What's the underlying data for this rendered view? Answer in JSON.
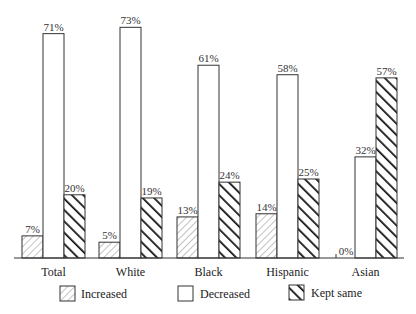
{
  "chart_data": {
    "type": "bar",
    "title": "",
    "xlabel": "",
    "ylabel": "",
    "ylim": [
      0,
      75
    ],
    "grid": false,
    "legend_position": "bottom",
    "categories": [
      "Total",
      "White",
      "Black",
      "Hispanic",
      "Asian"
    ],
    "series": [
      {
        "name": "Increased",
        "pattern": "light-hatch",
        "values": [
          7,
          5,
          13,
          14,
          0
        ]
      },
      {
        "name": "Decreased",
        "pattern": "empty",
        "values": [
          71,
          73,
          61,
          58,
          32
        ]
      },
      {
        "name": "Kept same",
        "pattern": "heavy-hatch",
        "values": [
          20,
          19,
          24,
          25,
          57
        ]
      }
    ],
    "value_suffix": "%"
  },
  "legend": {
    "increased": "Increased",
    "decreased": "Decreased",
    "kept_same": "Kept same"
  }
}
